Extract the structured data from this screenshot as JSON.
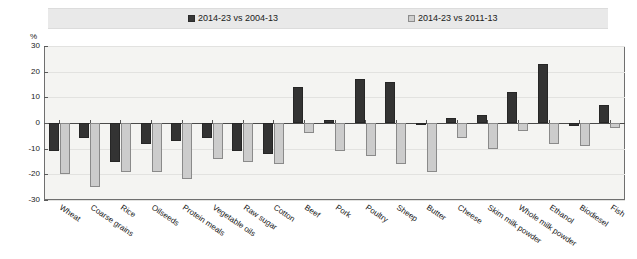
{
  "legend": {
    "entries": [
      {
        "label": "2014-23 vs 2004-13",
        "marker": "filled-square-icon",
        "color": "#383838"
      },
      {
        "label": "2014-23 vs 2011-13",
        "marker": "hatched-square-icon",
        "color": "#cfcfcf"
      }
    ]
  },
  "axis": {
    "unit": "%",
    "yticks": [
      "30",
      "20",
      "10",
      "0",
      "-10",
      "-20",
      "-30"
    ]
  },
  "chart_data": {
    "type": "bar",
    "title": "",
    "subtitle": "",
    "xlabel": "",
    "ylabel": "%",
    "ylim": [
      -30,
      30
    ],
    "ytick_values": [
      30,
      20,
      10,
      0,
      -10,
      -20,
      -30
    ],
    "grid": true,
    "legend_position": "top",
    "categories": [
      "Wheat",
      "Coarse grains",
      "Rice",
      "Oilseeds",
      "Protein meals",
      "Vegetable oils",
      "Raw sugar",
      "Cotton",
      "Beef",
      "Pork",
      "Poultry",
      "Sheep",
      "Butter",
      "Cheese",
      "Skim milk powder",
      "Whole milk powder",
      "Ethanol",
      "Biodiesel",
      "Fish"
    ],
    "series": [
      {
        "name": "2014-23 vs 2004-13",
        "color": "#333333",
        "values": [
          -11,
          -6,
          -15,
          -8,
          -7,
          -6,
          -11,
          -12,
          14,
          1,
          17,
          16,
          0,
          2,
          3,
          12,
          23,
          -1,
          7
        ]
      },
      {
        "name": "2014-23 vs 2011-13",
        "color": "#cccccc",
        "values": [
          -20,
          -25,
          -19,
          -19,
          -22,
          -14,
          -15,
          -16,
          -4,
          -11,
          -13,
          -16,
          -19,
          -6,
          -10,
          -3,
          -8,
          -9,
          -2
        ]
      }
    ]
  }
}
